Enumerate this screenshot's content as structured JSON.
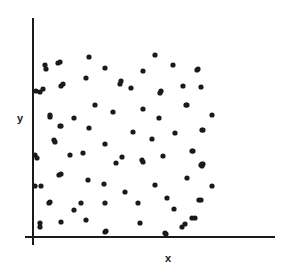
{
  "figure": {
    "title": "",
    "background_color": "#ffffff",
    "ink_color": "#1a1a1a"
  },
  "axes": {
    "x_label": "x",
    "y_label": "y",
    "x_axis_name": "x-axis-line",
    "y_axis_name": "y-axis-line",
    "x_axis": {
      "x1": 25,
      "y1": 237,
      "x2": 275,
      "y2": 237
    },
    "y_axis": {
      "x1": 33,
      "y1": 18,
      "x2": 33,
      "y2": 245
    },
    "line_width": 2,
    "ticks": [],
    "tick_labels": []
  },
  "chart_data": {
    "type": "scatter",
    "title": "",
    "subtitle": "",
    "xlabel": "x",
    "ylabel": "y",
    "xlim": [
      33,
      275
    ],
    "ylim": [
      18,
      237
    ],
    "grid": false,
    "legend": [],
    "legend_position": "none",
    "annotations": [],
    "marker": {
      "shape": "circle",
      "radius": 2.6,
      "color": "#1a1a1a"
    },
    "n_points": 78,
    "points": [
      [
        45,
        65
      ],
      [
        58,
        63
      ],
      [
        40,
        92
      ],
      [
        63,
        84
      ],
      [
        46,
        69
      ],
      [
        60,
        62
      ],
      [
        89,
        57
      ],
      [
        105,
        68
      ],
      [
        86,
        78
      ],
      [
        43,
        89
      ],
      [
        61,
        86
      ],
      [
        120,
        84
      ],
      [
        155,
        55
      ],
      [
        173,
        65
      ],
      [
        143,
        71
      ],
      [
        197,
        70
      ],
      [
        131,
        88
      ],
      [
        161,
        91
      ],
      [
        183,
        86
      ],
      [
        201,
        87
      ],
      [
        121,
        81
      ],
      [
        198,
        69
      ],
      [
        212,
        115
      ],
      [
        50,
        117
      ],
      [
        74,
        118
      ],
      [
        95,
        105
      ],
      [
        113,
        112
      ],
      [
        61,
        126
      ],
      [
        89,
        128
      ],
      [
        55,
        142
      ],
      [
        105,
        144
      ],
      [
        70,
        155
      ],
      [
        83,
        153
      ],
      [
        35,
        155
      ],
      [
        116,
        163
      ],
      [
        36,
        91
      ],
      [
        160,
        93
      ],
      [
        143,
        109
      ],
      [
        186,
        105
      ],
      [
        159,
        118
      ],
      [
        133,
        132
      ],
      [
        175,
        133
      ],
      [
        202,
        130
      ],
      [
        152,
        139
      ],
      [
        193,
        151
      ],
      [
        163,
        156
      ],
      [
        142,
        160
      ],
      [
        122,
        157
      ],
      [
        203,
        164
      ],
      [
        187,
        105
      ],
      [
        203,
        130
      ],
      [
        192,
        151
      ],
      [
        202,
        164
      ],
      [
        50,
        115
      ],
      [
        60,
        126
      ],
      [
        54,
        140
      ],
      [
        37,
        158
      ],
      [
        59,
        175
      ],
      [
        35,
        186
      ],
      [
        49,
        203
      ],
      [
        40,
        223
      ],
      [
        61,
        222
      ],
      [
        61,
        174
      ],
      [
        41,
        186
      ],
      [
        88,
        180
      ],
      [
        104,
        184
      ],
      [
        50,
        202
      ],
      [
        81,
        203
      ],
      [
        74,
        210
      ],
      [
        105,
        203
      ],
      [
        86,
        220
      ],
      [
        40,
        227
      ],
      [
        106,
        231
      ],
      [
        143,
        162
      ],
      [
        202,
        166
      ],
      [
        187,
        178
      ],
      [
        155,
        185
      ],
      [
        125,
        192
      ],
      [
        167,
        198
      ],
      [
        138,
        203
      ],
      [
        199,
        200
      ],
      [
        174,
        209
      ],
      [
        192,
        218
      ],
      [
        140,
        223
      ],
      [
        182,
        227
      ],
      [
        165,
        233
      ],
      [
        201,
        165
      ],
      [
        212,
        186
      ],
      [
        201,
        200
      ],
      [
        195,
        218
      ],
      [
        185,
        224
      ],
      [
        105,
        232
      ],
      [
        166,
        234
      ]
    ]
  }
}
